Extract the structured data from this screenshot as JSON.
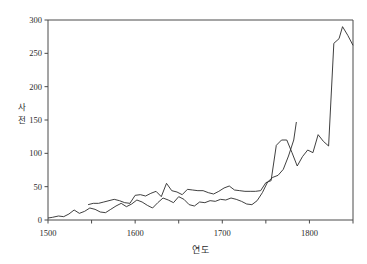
{
  "chart_data": {
    "type": "line",
    "title": "",
    "subtitle": "",
    "xlabel": "연도",
    "ylabel": "사전",
    "ylabel_chars": [
      "사",
      "전"
    ],
    "xlim": [
      1500,
      1850
    ],
    "ylim": [
      0,
      300
    ],
    "xticks": [
      1500,
      1600,
      1700,
      1800
    ],
    "xtick_labels": [
      "1500",
      "1600",
      "1700",
      "1800"
    ],
    "yticks": [
      0,
      50,
      100,
      150,
      200,
      250,
      300
    ],
    "ytick_labels": [
      "0",
      "50",
      "100",
      "150",
      "200",
      "250",
      "300"
    ],
    "grid": false,
    "legend": false,
    "legend_position": "none",
    "line_color": "#2a2a2a",
    "axis_color": "#4a4a4a",
    "background": "#ffffff",
    "series": [
      {
        "name": "series-1",
        "x": [
          1500,
          1505,
          1512,
          1518,
          1524,
          1530,
          1536,
          1542,
          1548,
          1554,
          1560,
          1566,
          1572,
          1578,
          1584,
          1590,
          1596,
          1602,
          1608,
          1614,
          1620,
          1626,
          1632,
          1638,
          1644,
          1650,
          1656,
          1662,
          1668,
          1674,
          1680,
          1686,
          1692,
          1698,
          1704,
          1710,
          1716,
          1722,
          1728,
          1734,
          1740,
          1746,
          1752,
          1758,
          1764,
          1770,
          1776,
          1782,
          1785
        ],
        "y": [
          3,
          4,
          6,
          5,
          9,
          15,
          10,
          13,
          18,
          16,
          12,
          11,
          16,
          21,
          25,
          20,
          24,
          30,
          27,
          22,
          18,
          26,
          33,
          30,
          26,
          35,
          31,
          23,
          21,
          27,
          26,
          29,
          28,
          31,
          30,
          33,
          31,
          28,
          24,
          23,
          29,
          41,
          57,
          64,
          67,
          76,
          96,
          120,
          147
        ]
      },
      {
        "name": "series-2",
        "x": [
          1546,
          1552,
          1558,
          1564,
          1570,
          1576,
          1582,
          1588,
          1594,
          1600,
          1606,
          1612,
          1618,
          1624,
          1630,
          1636,
          1642,
          1648,
          1654,
          1660,
          1666,
          1672,
          1678,
          1684,
          1690,
          1696,
          1702,
          1708,
          1714,
          1720,
          1726,
          1732,
          1738,
          1744,
          1750,
          1756,
          1762,
          1768,
          1774,
          1780,
          1786,
          1792,
          1798,
          1804,
          1810,
          1816,
          1822,
          1828,
          1834,
          1838,
          1844,
          1850
        ],
        "y": [
          23,
          25,
          25,
          27,
          29,
          31,
          29,
          26,
          25,
          37,
          38,
          36,
          40,
          43,
          35,
          55,
          44,
          42,
          38,
          46,
          45,
          44,
          44,
          41,
          39,
          43,
          48,
          51,
          45,
          44,
          43,
          43,
          43,
          44,
          56,
          59,
          112,
          120,
          120,
          101,
          81,
          95,
          105,
          101,
          128,
          118,
          111,
          265,
          272,
          290,
          277,
          262
        ]
      }
    ]
  }
}
